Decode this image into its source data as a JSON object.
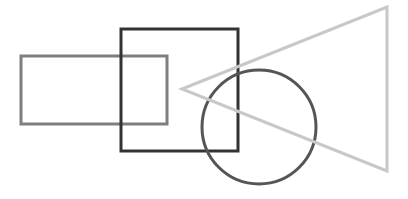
{
  "canvas": {
    "width": 408,
    "height": 199,
    "background": "#ffffff"
  },
  "shapes": {
    "rectangle": {
      "x": 21,
      "y": 56,
      "width": 146,
      "height": 68,
      "stroke": "#7f7f7f",
      "stroke_width": 3
    },
    "square": {
      "x": 121,
      "y": 29,
      "width": 117,
      "height": 122,
      "stroke": "#333333",
      "stroke_width": 3
    },
    "circle": {
      "cx": 259,
      "cy": 127,
      "r": 57,
      "stroke": "#555555",
      "stroke_width": 3
    },
    "triangle": {
      "points": "182,89 387,7 387,171",
      "stroke": "#c8c8c8",
      "stroke_width": 3
    }
  }
}
